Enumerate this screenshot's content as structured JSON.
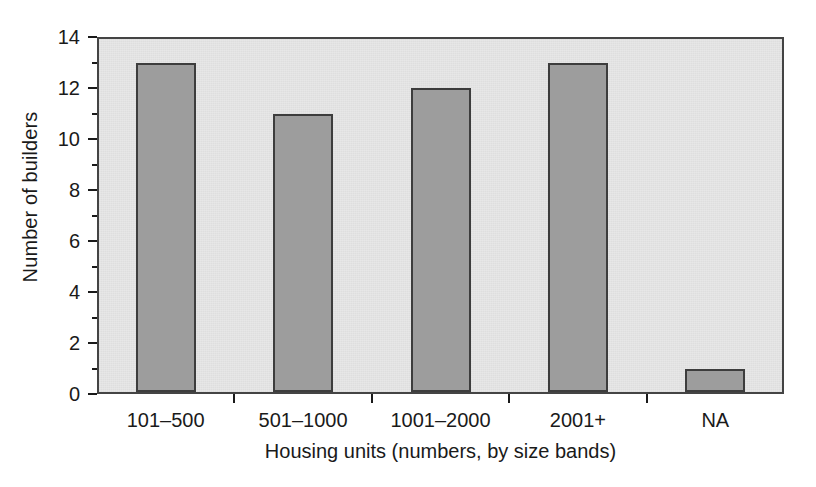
{
  "chart_data": {
    "type": "bar",
    "title": "",
    "categories": [
      "101–500",
      "501–1000",
      "1001–2000",
      "2001+",
      "NA"
    ],
    "values": [
      13,
      11,
      12,
      13,
      1
    ],
    "xlabel": "Housing units (numbers, by size bands)",
    "ylabel": "Number of builders",
    "ylim": [
      0,
      14
    ],
    "yticks": [
      0,
      2,
      4,
      6,
      8,
      10,
      12,
      14
    ],
    "ytick_labels": [
      "0",
      "2",
      "4",
      "6",
      "8",
      "10",
      "12",
      "14"
    ],
    "yminor_ticks": [
      1,
      3,
      5,
      7,
      9,
      11,
      13
    ],
    "grid": false,
    "legend": "none",
    "colors": {
      "bar_fill": "#9d9d9d",
      "bar_edge": "#3d3d3d",
      "plot_background": "#e7e7e7",
      "frame": "#444444",
      "text": "#1a1a1a",
      "figure_background": "#ffffff"
    }
  }
}
